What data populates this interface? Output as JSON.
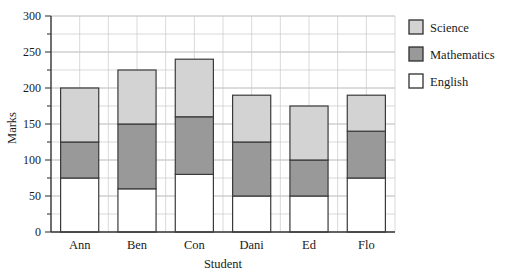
{
  "chart_data": {
    "type": "bar",
    "subtype": "stacked-bar",
    "title": "",
    "xlabel": "Student",
    "ylabel": "Marks",
    "categories": [
      "Ann",
      "Ben",
      "Con",
      "Dani",
      "Ed",
      "Flo"
    ],
    "series": [
      {
        "name": "English",
        "color": "#ffffff",
        "values": [
          75,
          60,
          80,
          50,
          50,
          75
        ]
      },
      {
        "name": "Mathematics",
        "color": "#999999",
        "values": [
          50,
          90,
          80,
          75,
          50,
          65
        ]
      },
      {
        "name": "Science",
        "color": "#d3d3d3",
        "values": [
          75,
          75,
          80,
          65,
          75,
          50
        ]
      }
    ],
    "cumulative_tops": {
      "English": [
        75,
        60,
        80,
        50,
        50,
        75
      ],
      "Mathematics": [
        125,
        150,
        160,
        125,
        100,
        140
      ],
      "Science": [
        200,
        225,
        240,
        190,
        175,
        190
      ]
    },
    "totals": [
      200,
      225,
      240,
      190,
      175,
      190
    ],
    "ylim": [
      0,
      300
    ],
    "xlim_categories": 6,
    "y_major_ticks": [
      0,
      50,
      100,
      150,
      200,
      250,
      300
    ],
    "y_major_tick_labels": [
      "0",
      "50",
      "100",
      "150",
      "200",
      "250",
      "300"
    ],
    "y_minor_tick_step": 25,
    "grid": true,
    "grid_axis": "both",
    "legend_position": "right",
    "legend_entries": [
      {
        "label": "Science",
        "color": "#d3d3d3"
      },
      {
        "label": "Mathematics",
        "color": "#999999"
      },
      {
        "label": "English",
        "color": "#ffffff"
      }
    ]
  },
  "axes": {
    "y_title": "Marks",
    "x_title": "Student",
    "y_tick_labels": [
      "300",
      "250",
      "200",
      "150",
      "100",
      "50",
      "0"
    ],
    "x_tick_labels": [
      "Ann",
      "Ben",
      "Con",
      "Dani",
      "Ed",
      "Flo"
    ]
  },
  "legend": {
    "items": [
      {
        "label": "Science"
      },
      {
        "label": "Mathematics"
      },
      {
        "label": "English"
      }
    ]
  }
}
